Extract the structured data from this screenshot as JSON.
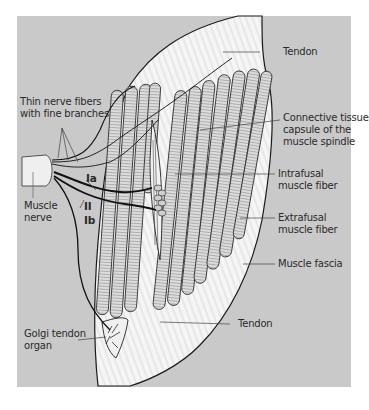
{
  "figure": {
    "type": "anatomical-diagram",
    "colors": {
      "panel_background": "#c9c9c9",
      "page_background": "#ffffff",
      "tissue_fill": "#f4f4f4",
      "fiber_fill": "#d9d9d9",
      "nerve_stroke": "#111111",
      "leader_line": "#444444"
    }
  },
  "labels": {
    "tendon_top": "Tendon",
    "thin_nerve_fibers": [
      "Thin nerve fibers",
      "with fine branches"
    ],
    "capsule": [
      "Connective tissue",
      "capsule of the",
      "muscle spindle"
    ],
    "intrafusal": [
      "Intrafusal",
      "muscle fiber"
    ],
    "extrafusal": [
      "Extrafusal",
      "muscle fiber"
    ],
    "muscle_fascia": "Muscle fascia",
    "tendon_bottom": "Tendon",
    "muscle_nerve": [
      "Muscle",
      "nerve"
    ],
    "golgi_tendon_organ": [
      "Golgi tendon",
      "organ"
    ],
    "fiber_ia": "Ia",
    "fiber_ii": "II",
    "fiber_ib": "Ib"
  }
}
